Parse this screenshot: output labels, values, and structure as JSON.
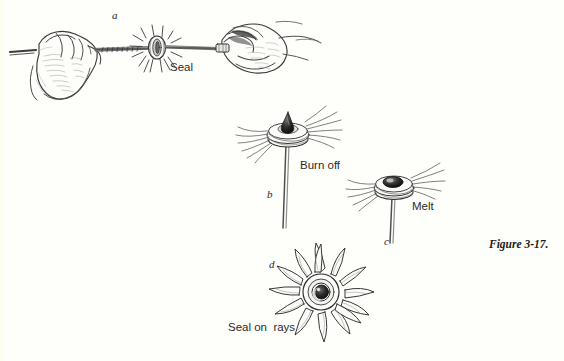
{
  "figure": {
    "caption": "Figure 3-17.",
    "background_color": "#fefefb",
    "ink_color": "#2b2b2b"
  },
  "panels": [
    {
      "key": "a",
      "key_label": "a",
      "label": "Seal",
      "description": "two-hands-sealing-rod-illustration"
    },
    {
      "key": "b",
      "key_label": "b",
      "label": "Burn off",
      "description": "bead-on-stem-burn-off-illustration"
    },
    {
      "key": "c",
      "key_label": "c",
      "label": "Melt",
      "description": "bead-on-stem-melt-illustration"
    },
    {
      "key": "d",
      "key_label": "d",
      "label": "Seal on  rays",
      "description": "sunburst-seal-on-rays-illustration"
    }
  ]
}
